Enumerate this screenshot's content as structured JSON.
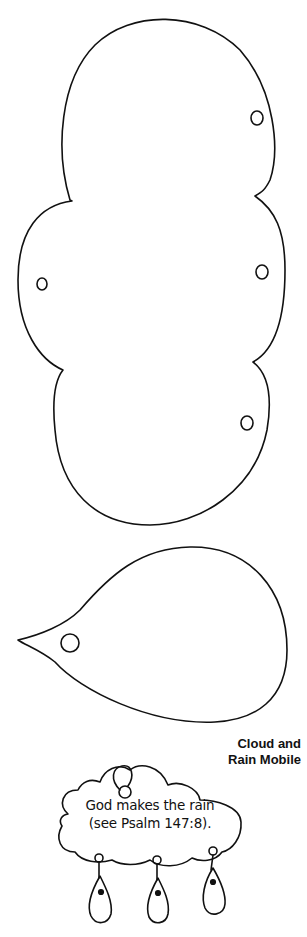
{
  "template": {
    "pieces": [
      {
        "name": "cloud-pattern",
        "description": "large three-lobed cloud cutout",
        "holes": 4
      },
      {
        "name": "raindrop-pattern",
        "description": "raindrop cutout pointing left",
        "holes": 1
      }
    ]
  },
  "caption": {
    "line1": "Cloud and",
    "line2": "Rain Mobile"
  },
  "example": {
    "verse_line1": "God makes the rain",
    "verse_line2": "(see Psalm 147:8).",
    "raindrops": 3
  },
  "colors": {
    "ink": "#111111",
    "paper": "#ffffff"
  }
}
